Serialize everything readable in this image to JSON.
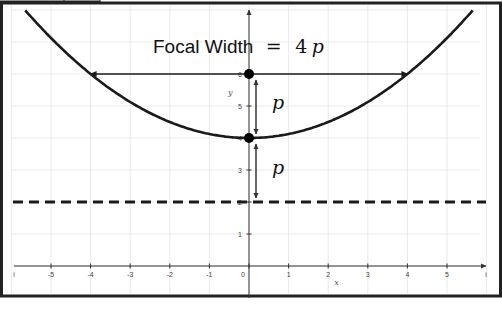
{
  "diagram": {
    "title_prefix": "Focal Width",
    "title_equals": "=",
    "title_value_num": "4",
    "title_value_var": "p",
    "p_label_upper": "p",
    "p_label_lower": "p",
    "x_axis_name": "x",
    "y_axis_name": "y",
    "colors": {
      "curve": "#1a1a1a",
      "grid": "#e4e4e4",
      "axis": "#333333",
      "frame": "#222222",
      "point": "#000000"
    }
  },
  "chart_data": {
    "type": "line",
    "xlabel": "x",
    "ylabel": "y",
    "xlim": [
      -6,
      6
    ],
    "ylim": [
      -0.8,
      7.5
    ],
    "x_ticks": [
      -5,
      -4,
      -3,
      -2,
      -1,
      0,
      1,
      2,
      3,
      4,
      5
    ],
    "x_tick_labels": [
      "-5",
      "-4",
      "-3",
      "-2",
      "-1",
      "0",
      "1",
      "2",
      "3",
      "4",
      "5"
    ],
    "x_edge_labels": [
      "i",
      "i"
    ],
    "y_ticks": [
      1,
      2,
      3,
      4,
      5,
      6
    ],
    "y_tick_labels": [
      "1",
      "2",
      "3",
      "4",
      "5",
      "6"
    ],
    "grid": true,
    "parabola": {
      "equation": "x^2 = 8(y - 4)",
      "vertex": [
        0,
        4
      ],
      "p": 2,
      "opens": "up"
    },
    "focus": [
      0,
      6
    ],
    "vertex_point": [
      0,
      4
    ],
    "directrix": {
      "y": 2,
      "style": "dashed"
    },
    "focal_width": {
      "y": 6,
      "x_from": -4,
      "x_to": 4,
      "value": 8
    },
    "distance_arrows": [
      {
        "from": [
          0,
          6
        ],
        "to": [
          0,
          4
        ],
        "label": "p"
      },
      {
        "from": [
          0,
          4
        ],
        "to": [
          0,
          2
        ],
        "label": "p"
      }
    ]
  }
}
